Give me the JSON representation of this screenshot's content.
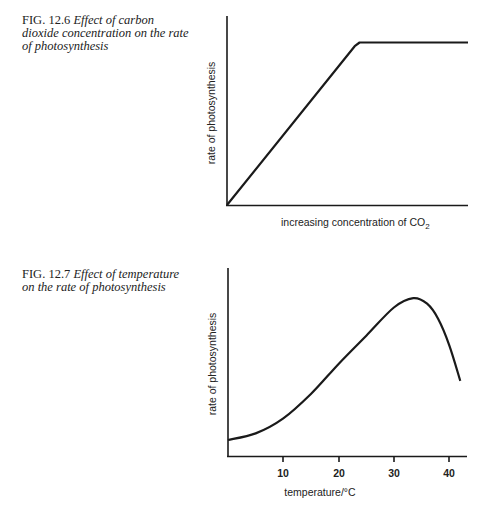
{
  "figures": [
    {
      "fig_label": "FIG.",
      "fig_number": "12.6",
      "caption_lines": [
        "Effect of carbon",
        "dioxide concentration on the rate",
        "of photosynthesis"
      ]
    },
    {
      "fig_label": "FIG.",
      "fig_number": "12.7",
      "caption_lines": [
        "Effect of temperature",
        "on the rate of photosynthesis"
      ]
    }
  ],
  "chart_data": [
    {
      "type": "line",
      "title": "FIG. 12.6 Effect of carbon dioxide concentration on the rate of photosynthesis",
      "xlabel": "increasing concentration of CO₂",
      "xlabel_main": "increasing concentration of CO",
      "xlabel_sub": "2",
      "ylabel": "rate of photosynthesis",
      "x_ticks": [],
      "y_ticks": [],
      "xlim": [
        0,
        100
      ],
      "ylim": [
        0,
        100
      ],
      "grid": false,
      "legend": null,
      "series": [
        {
          "name": "rate",
          "x": [
            0,
            53,
            55,
            100
          ],
          "y": [
            0,
            84,
            86,
            86
          ]
        }
      ],
      "annotations": [
        "linear increase then plateau (limiting factor)"
      ]
    },
    {
      "type": "line",
      "title": "FIG. 12.7 Effect of temperature on the rate of photosynthesis",
      "xlabel": "temperature/°C",
      "ylabel": "rate of photosynthesis",
      "x_ticks": [
        10,
        20,
        30,
        40
      ],
      "x_tick_labels": [
        "10",
        "20",
        "30",
        "40"
      ],
      "y_ticks": [],
      "xlim": [
        0,
        43
      ],
      "ylim": [
        0,
        100
      ],
      "grid": false,
      "legend": null,
      "series": [
        {
          "name": "rate",
          "x": [
            0,
            5,
            10,
            15,
            20,
            25,
            30,
            33.5,
            36,
            38,
            40,
            42
          ],
          "y": [
            8.5,
            12,
            20,
            33,
            49,
            64,
            79,
            84,
            81,
            73,
            59,
            40
          ]
        }
      ]
    }
  ]
}
